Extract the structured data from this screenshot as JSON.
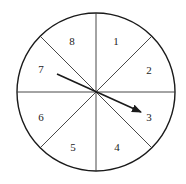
{
  "spinner": {
    "sections": 8,
    "labels": [
      "1",
      "2",
      "3",
      "4",
      "5",
      "6",
      "7",
      "8"
    ],
    "pointer_points_to": "3",
    "colors": {
      "line": "#1a1a1a",
      "background": "#ffffff"
    }
  }
}
